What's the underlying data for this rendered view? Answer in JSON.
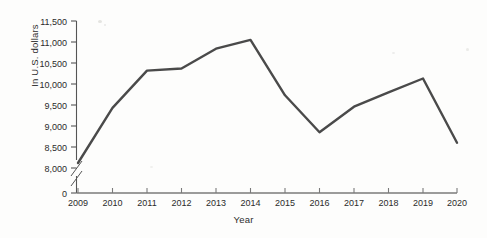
{
  "chart_data": {
    "type": "line",
    "title": "",
    "xlabel": "Year",
    "ylabel": "In U.S. dollars",
    "categories": [
      "2009",
      "2010",
      "2011",
      "2012",
      "2013",
      "2014",
      "2015",
      "2016",
      "2017",
      "2018",
      "2019",
      "2020"
    ],
    "values": [
      8120,
      9430,
      10320,
      10370,
      10840,
      11050,
      9730,
      8850,
      9460,
      9800,
      10130,
      8600
    ],
    "series": [
      {
        "name": "In U.S. dollars",
        "values": [
          8120,
          9430,
          10320,
          10370,
          10840,
          11050,
          9730,
          8850,
          9460,
          9800,
          10130,
          8600
        ]
      }
    ],
    "ylim": [
      8000,
      11500
    ],
    "ytick_labels": [
      "8,000",
      "8,500",
      "9,000",
      "9,500",
      "10,000",
      "10,500",
      "11,000",
      "11,500"
    ],
    "ytick_values": [
      8000,
      8500,
      9000,
      9500,
      10000,
      10500,
      11000,
      11500
    ],
    "zero_tick_label": "0",
    "axis_break": true,
    "grid": false,
    "legend": false,
    "legend_position": "none",
    "line_color": "#4a4a4a",
    "axis_color": "#555555",
    "background_color": "#fdfdfc"
  }
}
